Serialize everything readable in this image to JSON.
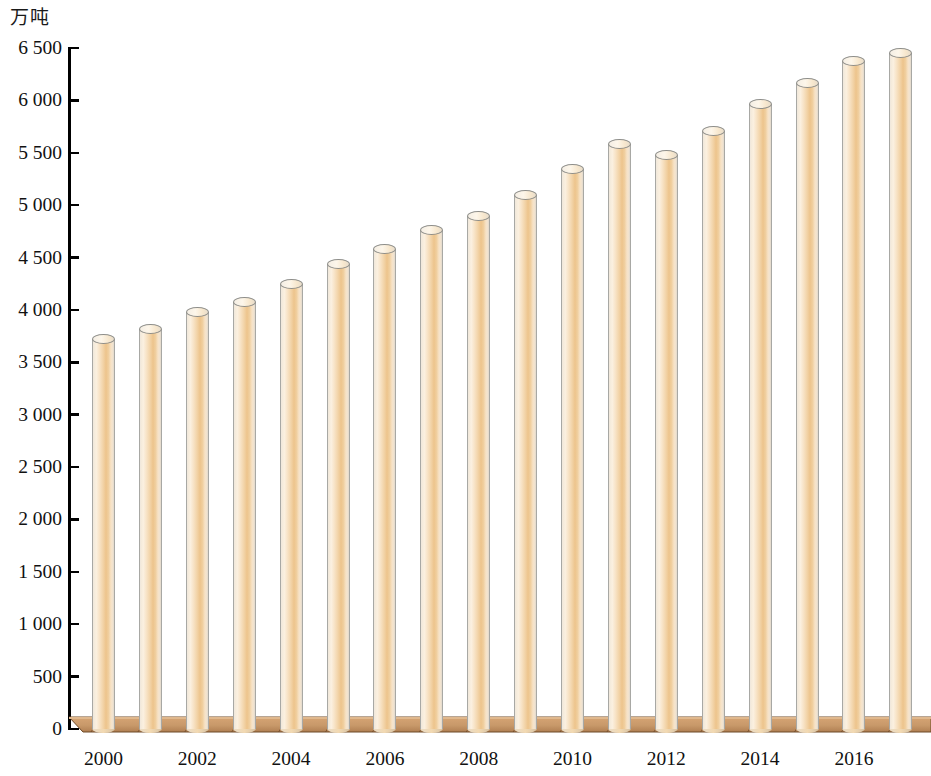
{
  "chart_data": {
    "type": "bar",
    "title": "",
    "subtitle": "",
    "xlabel": "",
    "ylabel": "万吨",
    "unit_label": "万吨",
    "categories": [
      "2000",
      "2001",
      "2002",
      "2003",
      "2004",
      "2005",
      "2006",
      "2007",
      "2008",
      "2009",
      "2010",
      "2011",
      "2012",
      "2013",
      "2014",
      "2015",
      "2016",
      "2017"
    ],
    "values": [
      3720,
      3820,
      3980,
      4080,
      4250,
      4440,
      4580,
      4760,
      4900,
      5100,
      5350,
      5580,
      5480,
      5710,
      5970,
      6170,
      6380,
      6450
    ],
    "ylim": [
      0,
      6500
    ],
    "y_ticks": [
      0,
      500,
      1000,
      1500,
      2000,
      2500,
      3000,
      3500,
      4000,
      4500,
      5000,
      5500,
      6000,
      6500
    ],
    "y_tick_labels": [
      "0",
      "500",
      "1 000",
      "1 500",
      "2 000",
      "2 500",
      "3 000",
      "3 500",
      "4 000",
      "4 500",
      "5 000",
      "5 500",
      "6 000",
      "6 500"
    ],
    "x_tick_labels": [
      "2000",
      "2002",
      "2004",
      "2006",
      "2008",
      "2010",
      "2012",
      "2014",
      "2016"
    ],
    "x_tick_indices": [
      0,
      2,
      4,
      6,
      8,
      10,
      12,
      14,
      16
    ],
    "grid": false,
    "legend": [],
    "legend_position": "none",
    "bar_color": "#edc48c",
    "bar_edge_color": "#a8a8a4",
    "platform_color": "#c8996a",
    "axis_color": "#000000"
  }
}
